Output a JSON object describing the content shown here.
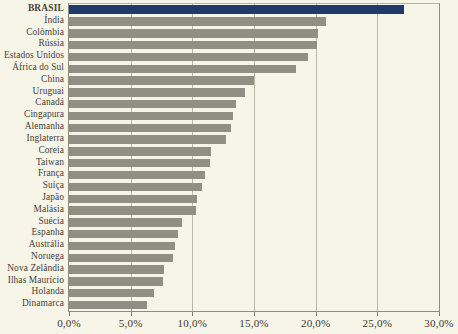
{
  "chart_data": {
    "type": "bar",
    "orientation": "horizontal",
    "title": "",
    "subtitle": "",
    "xlabel": "",
    "ylabel": "",
    "xlim": [
      0,
      30
    ],
    "ylim": null,
    "grid": true,
    "legend": null,
    "legend_position": "none",
    "x_tick_labels": [
      "0,0%",
      "5,0%",
      "10,0%",
      "15,0%",
      "20,0%",
      "25,0%",
      "30,0%"
    ],
    "x_tick_values": [
      0,
      5,
      10,
      15,
      20,
      25,
      30
    ],
    "highlight_category": "BRASIL",
    "colors": {
      "bar": "#918f83",
      "highlight_bar": "#22386e",
      "background": "#f7f4e8",
      "gridline": "#b9b7a8",
      "axis": "#8d8b7e",
      "text": "#44423a"
    },
    "categories": [
      "BRASIL",
      "Índia",
      "Colômbia",
      "Rússia",
      "Estados Unidos",
      "África do Sul",
      "China",
      "Uruguai",
      "Canadá",
      "Cingapura",
      "Alemanha",
      "Inglaterra",
      "Coreia",
      "Taiwan",
      "França",
      "Suíça",
      "Japão",
      "Malásia",
      "Suécia",
      "Espanha",
      "Austrália",
      "Noruega",
      "Nova Zelândia",
      "Ilhas Maurício",
      "Holanda",
      "Dinamarca"
    ],
    "values": [
      27.2,
      20.8,
      20.2,
      20.1,
      19.4,
      18.4,
      15.0,
      14.3,
      13.5,
      13.3,
      13.1,
      12.7,
      11.5,
      11.4,
      11.0,
      10.8,
      10.4,
      10.3,
      9.2,
      8.8,
      8.6,
      8.4,
      7.7,
      7.6,
      6.9,
      6.3
    ]
  }
}
